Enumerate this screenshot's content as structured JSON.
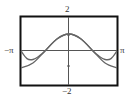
{
  "chart_data": {
    "type": "line",
    "title": "",
    "xlabel": "",
    "ylabel": "",
    "xlim": [
      -3.14159,
      3.14159
    ],
    "ylim": [
      -2,
      2
    ],
    "x_tick_labels": [
      "-π",
      "π"
    ],
    "y_tick_labels": [
      "2",
      "-2"
    ],
    "grid": false,
    "series": [
      {
        "name": "curve-1",
        "x": [
          -3.14,
          -2.36,
          -1.57,
          -0.79,
          0,
          0.79,
          1.57,
          2.36,
          3.14
        ],
        "y": [
          -1.0,
          -0.71,
          0.0,
          0.71,
          1.0,
          0.71,
          0.0,
          -0.71,
          -1.0
        ]
      },
      {
        "name": "curve-2",
        "x": [
          -3.14,
          -2.75,
          -2.36,
          -1.96,
          -1.57,
          -0.79,
          0,
          0.79,
          1.57,
          1.96,
          2.36,
          2.75,
          3.14
        ],
        "y": [
          0.0,
          -0.45,
          -0.5,
          -0.3,
          0.0,
          0.71,
          1.0,
          0.71,
          0.0,
          -0.3,
          -0.5,
          -0.45,
          0.0
        ]
      }
    ]
  },
  "labels": {
    "ymax": "2",
    "ymin": "−2",
    "xmin": "−π",
    "xmax": "π"
  }
}
